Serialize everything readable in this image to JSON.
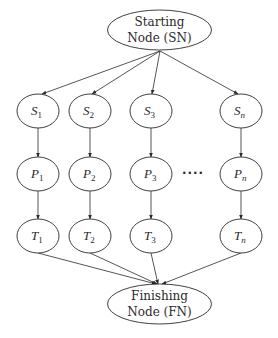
{
  "diagram": {
    "start_node": {
      "line1": "Starting",
      "line2": "Node (SN)"
    },
    "finish_node": {
      "line1": "Finishing",
      "line2": "Node (FN)"
    },
    "columns": [
      {
        "s": {
          "var": "S",
          "sub": "1"
        },
        "p": {
          "var": "P",
          "sub": "1"
        },
        "t": {
          "var": "T",
          "sub": "1"
        }
      },
      {
        "s": {
          "var": "S",
          "sub": "2"
        },
        "p": {
          "var": "P",
          "sub": "2"
        },
        "t": {
          "var": "T",
          "sub": "2"
        }
      },
      {
        "s": {
          "var": "S",
          "sub": "3"
        },
        "p": {
          "var": "P",
          "sub": "3"
        },
        "t": {
          "var": "T",
          "sub": "3"
        }
      },
      {
        "s": {
          "var": "S",
          "sub": "n"
        },
        "p": {
          "var": "P",
          "sub": "n"
        },
        "t": {
          "var": "T",
          "sub": "n"
        }
      }
    ],
    "ellipsis": "····",
    "colors": {
      "stroke": "#2a2a2a",
      "background": "#ffffff"
    }
  }
}
